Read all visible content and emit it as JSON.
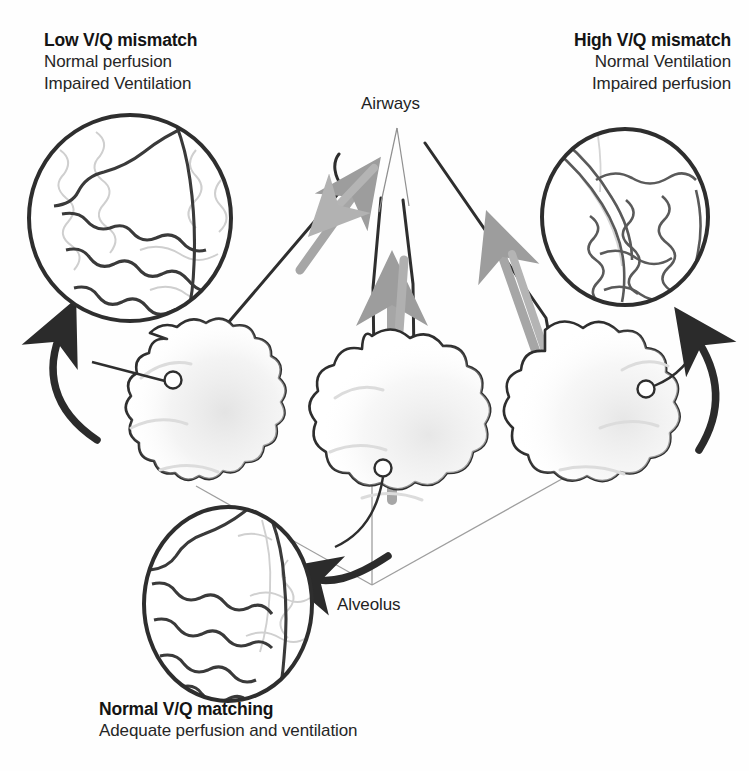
{
  "figure": {
    "background_color": "#fefefe",
    "ink_color": "#2b2b2b",
    "faint_ink_color": "#c9c9c9",
    "airflow_arrow_color": "#9a9a9a",
    "shading_color": "#e6e6e6"
  },
  "callouts": {
    "low_vq": {
      "title": "Low V/Q mismatch",
      "line1": "Normal perfusion",
      "line2": "Impaired Ventilation"
    },
    "high_vq": {
      "title": "High V/Q mismatch",
      "line1": "Normal Ventilation",
      "line2": "Impaired perfusion"
    },
    "normal_vq": {
      "title": "Normal V/Q matching",
      "line1": "Adequate perfusion and ventilation"
    }
  },
  "structure_labels": {
    "airways": "Airways",
    "alveolus": "Alveolus"
  },
  "insets": [
    {
      "id": "inset-low-vq",
      "name": "low-vq-alveolus-inset",
      "position": "top-left",
      "perfusion": "normal",
      "ventilation": "impaired",
      "capillary_rendering": "dark-bold",
      "alveolar_membrane_rendering": "faint"
    },
    {
      "id": "inset-high-vq",
      "name": "high-vq-alveolus-inset",
      "position": "top-right",
      "perfusion": "impaired",
      "ventilation": "normal",
      "capillary_rendering": "faint-thin",
      "alveolar_membrane_rendering": "dark"
    },
    {
      "id": "inset-normal-vq",
      "name": "normal-vq-alveolus-inset",
      "position": "bottom-left",
      "perfusion": "adequate",
      "ventilation": "adequate",
      "capillary_rendering": "dark-bold",
      "alveolar_membrane_rendering": "dark"
    }
  ],
  "alveolar_clusters": [
    {
      "id": "cluster-left",
      "name": "left-alveolar-cluster",
      "linked_inset": "inset-low-vq",
      "shaded": true
    },
    {
      "id": "cluster-center",
      "name": "center-alveolar-cluster",
      "linked_inset": "inset-normal-vq",
      "shaded": true
    },
    {
      "id": "cluster-right",
      "name": "right-alveolar-cluster",
      "linked_inset": "inset-high-vq",
      "shaded": true
    }
  ],
  "airflow_arrows": [
    {
      "id": "airflow-left",
      "direction": "bidirectional",
      "target": "cluster-left"
    },
    {
      "id": "airflow-center",
      "direction": "bidirectional",
      "target": "cluster-center"
    },
    {
      "id": "airflow-right",
      "direction": "bidirectional",
      "target": "cluster-right"
    }
  ],
  "pointer_arrows": [
    {
      "id": "pointer-left",
      "from": "cluster-left",
      "to": "inset-low-vq"
    },
    {
      "id": "pointer-right",
      "from": "cluster-right",
      "to": "inset-high-vq"
    },
    {
      "id": "pointer-bottom",
      "from": "cluster-center",
      "to": "inset-normal-vq"
    }
  ]
}
